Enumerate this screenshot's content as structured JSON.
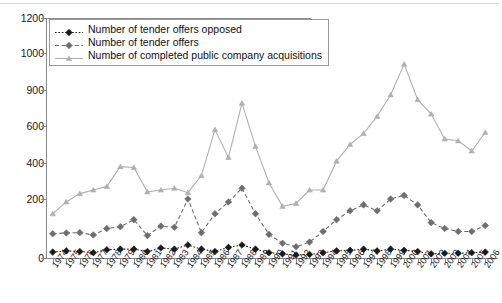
{
  "chart_data": {
    "type": "line",
    "title": "",
    "xlabel": "",
    "ylabel": "",
    "grid": false,
    "legend_position": "top-left",
    "x": [
      "1974",
      "1975",
      "1976",
      "1977",
      "1978",
      "1979",
      "1980",
      "1981",
      "1982",
      "1983",
      "1984",
      "1985",
      "1986",
      "1987",
      "1988",
      "1989",
      "1990",
      "1991",
      "1992",
      "1993",
      "1994",
      "1995",
      "1996",
      "1997",
      "1998",
      "1999",
      "2000",
      "2001",
      "2002",
      "2003",
      "2004",
      "2005",
      "2006"
    ],
    "ytick_labels": [
      "0",
      "200",
      "400",
      "600",
      "900",
      "1000",
      "1200"
    ],
    "ytick_values": [
      0,
      200,
      400,
      600,
      900,
      1000,
      1200
    ],
    "ylim": [
      0,
      1200
    ],
    "series": [
      {
        "name": "Number of tender offers opposed",
        "color": "#1a1a1a",
        "marker": "diamond",
        "dash": "dotted",
        "values": [
          20,
          24,
          22,
          18,
          28,
          30,
          30,
          22,
          34,
          30,
          44,
          30,
          22,
          36,
          44,
          30,
          18,
          14,
          10,
          12,
          18,
          24,
          26,
          30,
          24,
          30,
          26,
          22,
          14,
          16,
          16,
          18,
          20
        ]
      },
      {
        "name": "Number of tender offers",
        "color": "#6e6e6e",
        "marker": "diamond",
        "dash": "dashed",
        "values": [
          82,
          85,
          86,
          78,
          100,
          106,
          130,
          76,
          108,
          104,
          200,
          86,
          150,
          190,
          260,
          150,
          80,
          50,
          38,
          54,
          90,
          130,
          160,
          180,
          160,
          200,
          220,
          180,
          120,
          100,
          90,
          90,
          110
        ]
      },
      {
        "name": "Number of completed public company acquisitions",
        "color": "#b0b0b0",
        "marker": "triangle",
        "dash": "solid",
        "values": [
          150,
          190,
          230,
          250,
          270,
          380,
          375,
          240,
          250,
          260,
          235,
          330,
          580,
          430,
          790,
          490,
          290,
          175,
          185,
          250,
          250,
          410,
          500,
          560,
          680,
          860,
          970,
          820,
          700,
          530,
          520,
          465,
          565
        ]
      }
    ]
  }
}
